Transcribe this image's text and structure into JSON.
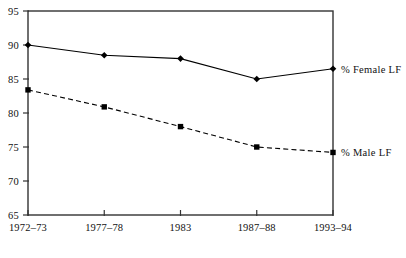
{
  "chart_data": {
    "type": "line",
    "title": "",
    "subtitle": "",
    "xlabel": "",
    "ylabel": "",
    "categories": [
      "1972–73",
      "1977–78",
      "1983",
      "1987–88",
      "1993–94"
    ],
    "ylim": [
      65,
      95
    ],
    "yticks": [
      65,
      70,
      75,
      80,
      85,
      90,
      95
    ],
    "ytick_labels": [
      "65",
      "70",
      "75",
      "80",
      "85",
      "90",
      "95"
    ],
    "grid": false,
    "legend_position": "right-inline",
    "series": [
      {
        "name": "% Female LF",
        "values": [
          90.0,
          88.5,
          88.0,
          85.0,
          86.5
        ],
        "marker": "diamond",
        "line_style": "solid",
        "color": "#000000"
      },
      {
        "name": "% Male LF",
        "values": [
          83.4,
          80.9,
          78.0,
          75.0,
          74.2
        ],
        "marker": "square",
        "line_style": "dashed",
        "color": "#000000"
      }
    ]
  },
  "axes": {
    "y_axis_name": "y-axis",
    "x_axis_name": "x-axis"
  },
  "colors": {
    "foreground": "#000000",
    "background": "#ffffff",
    "axis": "#333333"
  }
}
